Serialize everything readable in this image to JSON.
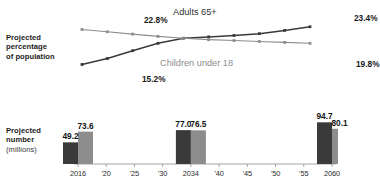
{
  "labels": {
    "percentage_block": [
      "Projected",
      "percentage",
      "of population"
    ],
    "number_block": [
      "Projected",
      "number",
      "(millions)"
    ]
  },
  "colors": {
    "dark_series": "#3a3a3a",
    "light_series": "#8d8d8d",
    "axis": "#9a9a9a",
    "background": "#ffffff"
  },
  "chart_data": [
    {
      "type": "line",
      "title": "",
      "xlabel": "",
      "ylabel": "Projected percentage of population",
      "grid": false,
      "legend_position": "inline-annotation",
      "x": [
        "2016",
        "'20",
        "'25",
        "'30",
        "2034",
        "'40",
        "'45",
        "'50",
        "'55",
        "2060"
      ],
      "ylim": [
        14.0,
        24.0
      ],
      "series": [
        {
          "name": "Adults 65+",
          "color": "#3a3a3a",
          "values": [
            15.2,
            16.5,
            18.2,
            19.8,
            20.9,
            21.2,
            21.5,
            21.9,
            22.6,
            23.4
          ],
          "start_label": "15.2%",
          "end_label": "23.4%"
        },
        {
          "name": "Children under 18",
          "color": "#8d8d8d",
          "values": [
            22.8,
            22.3,
            21.8,
            21.3,
            20.9,
            20.6,
            20.4,
            20.2,
            20.0,
            19.8
          ],
          "start_label": "22.8%",
          "end_label": "19.8%"
        }
      ],
      "annotations": [
        {
          "text": "Adults 65+",
          "kind": "series-title"
        },
        {
          "text": "Children under 18",
          "kind": "series-title"
        }
      ]
    },
    {
      "type": "bar",
      "title": "",
      "xlabel": "",
      "ylabel": "Projected number (millions)",
      "grid": false,
      "ylim": [
        0,
        100
      ],
      "categories": [
        "2016",
        "2034",
        "2060"
      ],
      "tick_labels": [
        "2016",
        "'20",
        "'25",
        "'30",
        "2034",
        "'40",
        "'45",
        "'50",
        "'55",
        "2060"
      ],
      "series": [
        {
          "name": "Adults 65+",
          "color": "#3a3a3a",
          "values": [
            49.2,
            77.0,
            94.7
          ],
          "value_labels": [
            "49.2",
            "77.0",
            "94.7"
          ]
        },
        {
          "name": "Children under 18",
          "color": "#8d8d8d",
          "values": [
            73.6,
            76.5,
            80.1
          ],
          "value_labels": [
            "73.6",
            "76.5",
            "80.1"
          ]
        }
      ]
    }
  ]
}
